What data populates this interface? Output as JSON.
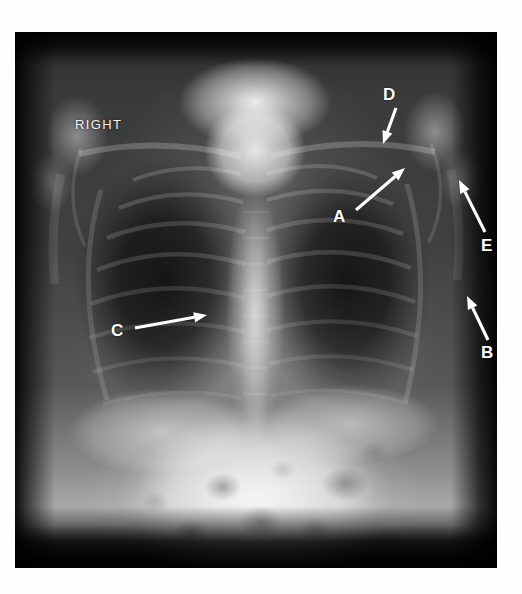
{
  "image": {
    "modality": "chest-radiograph",
    "view": "frontal",
    "side_marker": "RIGHT"
  },
  "annotations": [
    {
      "id": "A",
      "label": "A",
      "label_x": 318,
      "label_y": 176,
      "tail_x": 341,
      "tail_y": 178,
      "tip_x": 390,
      "tip_y": 136,
      "arrow_direction": "up-right"
    },
    {
      "id": "B",
      "label": "B",
      "label_x": 466,
      "label_y": 312,
      "tail_x": 473,
      "tail_y": 308,
      "tip_x": 452,
      "tip_y": 264,
      "arrow_direction": "up-left"
    },
    {
      "id": "C",
      "label": "C",
      "label_x": 96,
      "label_y": 290,
      "tail_x": 120,
      "tail_y": 296,
      "tip_x": 192,
      "tip_y": 283,
      "arrow_direction": "right"
    },
    {
      "id": "D",
      "label": "D",
      "label_x": 368,
      "label_y": 54,
      "tail_x": 381,
      "tail_y": 76,
      "tip_x": 368,
      "tip_y": 112,
      "arrow_direction": "down-left"
    },
    {
      "id": "E",
      "label": "E",
      "label_x": 466,
      "label_y": 205,
      "tail_x": 470,
      "tail_y": 200,
      "tip_x": 444,
      "tip_y": 148,
      "arrow_direction": "up-left"
    }
  ],
  "colors": {
    "page_background": "#ffffff",
    "annotation": "#ffffff",
    "film_dark": "#0a0a0a"
  }
}
